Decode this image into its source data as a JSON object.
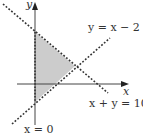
{
  "diagram": {
    "type": "linear-inequality-region",
    "axes": {
      "x_label": "x",
      "y_label": "y"
    },
    "lines": [
      {
        "id": "l1",
        "equation": "y = x − 2",
        "style": "dotted"
      },
      {
        "id": "l2",
        "equation": "x + y = 10",
        "style": "dotted"
      },
      {
        "id": "l3",
        "equation": "x = 0",
        "style": "dotted"
      }
    ],
    "labels": {
      "y_eq_x_minus_2": "y = x − 2",
      "x_plus_y_eq_10": "x + y = 10",
      "x_eq_0": "x = 0",
      "x_axis": "x",
      "y_axis": "y"
    },
    "region": {
      "description": "shaded triangle bounded by x = 0, y = x − 2, x + y = 10",
      "vertices": [
        [
          0,
          10
        ],
        [
          6,
          4
        ],
        [
          0,
          -2
        ]
      ],
      "fill": "#cccccc"
    },
    "colors": {
      "line": "#333333",
      "axis": "#444444",
      "shade": "#cccccc"
    }
  }
}
